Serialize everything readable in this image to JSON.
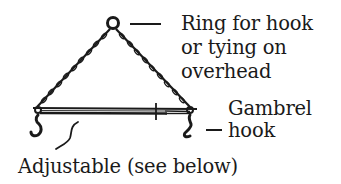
{
  "diagram": {
    "labels": {
      "ring": [
        "Ring for hook",
        "or tying on",
        "overhead"
      ],
      "gambrel_hook": [
        "Gambrel",
        "hook"
      ],
      "adjustable": "Adjustable (see below)"
    },
    "parts": [
      "ring",
      "left-chain",
      "right-chain",
      "gambrel-bar",
      "left-hook",
      "right-hook"
    ],
    "colors": {
      "ink": "#1a1a1a",
      "background": "#ffffff"
    }
  }
}
